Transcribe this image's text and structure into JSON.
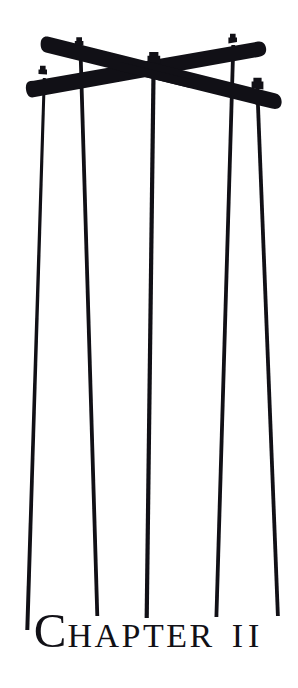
{
  "page": {
    "width": 298,
    "height": 688,
    "background_color": "#ffffff",
    "ink_color": "#111016"
  },
  "illustration": {
    "name": "crossed-telegraph-crossarms-with-hanging-wires",
    "description": "Silhouette woodcut of two crossed wooden crossarms forming an X, with five insulator pins on top and five wires hanging straight down",
    "ink_color": "#111016",
    "beams": [
      {
        "name": "beam-upper-left-to-lower-right",
        "x1": 48,
        "y1": 46,
        "x2": 281,
        "y2": 103,
        "thickness": 19
      },
      {
        "name": "beam-lower-left-to-upper-right",
        "x1": 31,
        "y1": 92,
        "x2": 264,
        "y2": 50,
        "thickness": 19
      }
    ],
    "insulator_pins": [
      {
        "name": "pin-1",
        "x": 42,
        "y": 78
      },
      {
        "name": "pin-2",
        "x": 79,
        "y": 49
      },
      {
        "name": "pin-3",
        "x": 153,
        "y": 60
      },
      {
        "name": "pin-4",
        "x": 232,
        "y": 45
      },
      {
        "name": "pin-5",
        "x": 257,
        "y": 90
      }
    ],
    "wires": [
      {
        "name": "wire-1",
        "x_top": 42,
        "y_top": 82,
        "x_bottom": 25,
        "y_bottom": 630
      },
      {
        "name": "wire-2",
        "x_top": 80,
        "y_top": 54,
        "x_bottom": 97,
        "y_bottom": 616
      },
      {
        "name": "wire-3",
        "x_top": 153,
        "y_top": 64,
        "x_bottom": 146,
        "y_bottom": 618
      },
      {
        "name": "wire-4",
        "x_top": 232,
        "y_top": 50,
        "x_bottom": 216,
        "y_bottom": 617
      },
      {
        "name": "wire-5",
        "x_top": 257,
        "y_top": 94,
        "x_bottom": 278,
        "y_bottom": 616
      }
    ]
  },
  "heading": {
    "drop_cap": "C",
    "word_rest": "HAPTER",
    "numeral": "II",
    "full_text": "CHAPTER II"
  }
}
